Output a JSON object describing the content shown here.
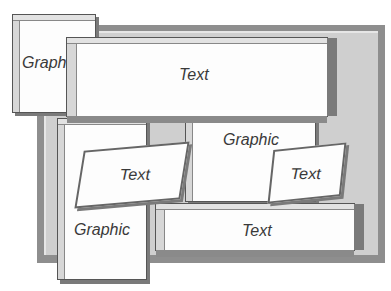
{
  "diagram": {
    "title": "",
    "blocks": [
      {
        "id": "graphic-top-left",
        "type": "graphic",
        "label": "Graphic"
      },
      {
        "id": "text-top-wide",
        "type": "text",
        "label": "Text"
      },
      {
        "id": "graphic-middle",
        "type": "graphic",
        "label": "Graphic"
      },
      {
        "id": "graphic-left-tall",
        "type": "graphic",
        "label": "Graphic"
      },
      {
        "id": "text-skewed-left",
        "type": "text",
        "label": "Text"
      },
      {
        "id": "text-skewed-right",
        "type": "text",
        "label": "Text"
      },
      {
        "id": "text-bottom-wide",
        "type": "text",
        "label": "Text"
      }
    ],
    "colors": {
      "panel": "#fdfdfd",
      "frame_dark": "#8e8e8e",
      "frame_light": "#cfcfcf",
      "bevel_dark": "#7a7a7a",
      "label": "#3a3a3a"
    }
  }
}
